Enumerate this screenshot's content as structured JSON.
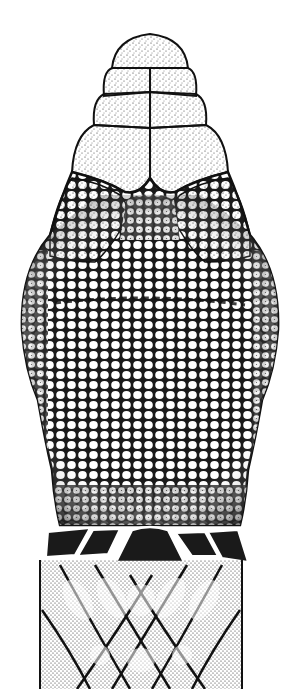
{
  "image": {
    "subject": "snake head, dorsal view",
    "style": "stippled pen-and-ink scientific illustration",
    "width": 300,
    "height": 689,
    "colors": {
      "background": "#ffffff",
      "ink": "#111111",
      "stipple": "#222222"
    },
    "regions": [
      {
        "name": "rostral-scale",
        "label": "rostral"
      },
      {
        "name": "internasal-scales",
        "label": "internasals"
      },
      {
        "name": "prefrontal-scales",
        "label": "prefrontals"
      },
      {
        "name": "supraocular-scales",
        "label": "supraoculars"
      },
      {
        "name": "crown-small-scales",
        "label": "small head scales"
      },
      {
        "name": "neck-band",
        "label": "dark triangular neck markings"
      },
      {
        "name": "body-crossbands",
        "label": "crossing dorsal pattern"
      }
    ]
  }
}
